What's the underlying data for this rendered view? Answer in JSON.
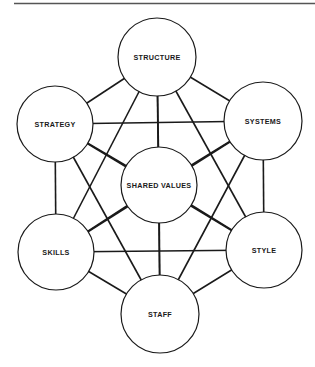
{
  "diagram": {
    "type": "fully-connected network",
    "colors": {
      "line": "#1a1a1a",
      "fill": "#ffffff",
      "rule": "#555555"
    },
    "nodes": [
      {
        "id": "structure",
        "label": "STRUCTURE",
        "cx": 157,
        "cy": 57,
        "r": 39
      },
      {
        "id": "strategy",
        "label": "STRATEGY",
        "cx": 55,
        "cy": 124,
        "r": 38
      },
      {
        "id": "systems",
        "label": "SYSTEMS",
        "cx": 263,
        "cy": 121,
        "r": 39
      },
      {
        "id": "shared-values",
        "label": "SHARED VALUES",
        "cx": 159,
        "cy": 185,
        "r": 38
      },
      {
        "id": "skills",
        "label": "SKILLS",
        "cx": 56,
        "cy": 252,
        "r": 38
      },
      {
        "id": "style",
        "label": "STYLE",
        "cx": 264,
        "cy": 250,
        "r": 38
      },
      {
        "id": "staff",
        "label": "STAFF",
        "cx": 160,
        "cy": 314,
        "r": 39
      }
    ]
  }
}
